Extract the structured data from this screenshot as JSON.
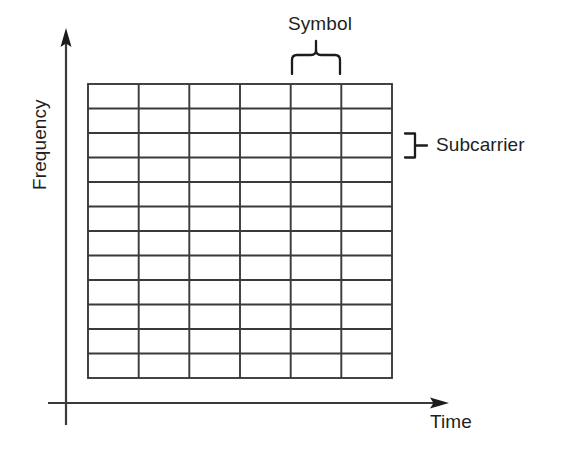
{
  "diagram": {
    "background_color": "#ffffff",
    "line_color": "#3a3a3c",
    "text_color": "#231f20"
  },
  "axes": {
    "y": {
      "label": "Frequency",
      "orientation": "vertical",
      "arrow": "up",
      "x": 66,
      "top": 30,
      "bottom": 425
    },
    "x": {
      "label": "Time",
      "orientation": "horizontal",
      "arrow": "right",
      "y": 403,
      "left": 48,
      "right": 446
    }
  },
  "grid": {
    "name": "resource-grid",
    "columns": 6,
    "rows": 12,
    "left": 88,
    "top": 84,
    "right": 392,
    "bottom": 378,
    "cell_width": 50.7,
    "cell_height": 24.5,
    "column_meaning": "Symbol",
    "row_meaning": "Subcarrier"
  },
  "annotations": {
    "symbol": {
      "label": "Symbol",
      "brace_type": "curly-brace-down",
      "spans": "one column (5th)",
      "brace_left": 291,
      "brace_right": 342,
      "brace_top": 52,
      "brace_bottom": 72
    },
    "subcarrier": {
      "label": "Subcarrier",
      "brace_type": "right-bracket",
      "spans": "one row",
      "brace_x": 404,
      "brace_top": 133,
      "brace_bottom": 158,
      "tick_right": 424
    }
  }
}
